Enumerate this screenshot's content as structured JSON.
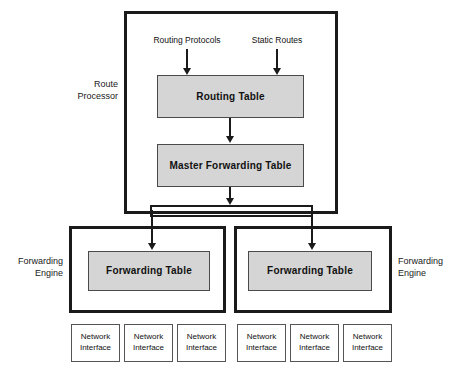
{
  "diagram": {
    "colors": {
      "table_fill": "#d5d5d5",
      "outline": "#1a1a1a",
      "interface_fill": "#ffffff"
    }
  },
  "route_processor": {
    "label": "Route\nProcessor",
    "inlets": [
      {
        "label": "Routing Protocols"
      },
      {
        "label": "Static Routes"
      }
    ],
    "routing_table": {
      "label": "Routing Table"
    },
    "master_forwarding_table": {
      "label": "Master Forwarding Table"
    }
  },
  "forwarding_engines": [
    {
      "label": "Forwarding\nEngine",
      "table": {
        "label": "Forwarding Table"
      },
      "interfaces": [
        {
          "label": "Network\nInterface"
        },
        {
          "label": "Network\nInterface"
        },
        {
          "label": "Network\nInterface"
        }
      ]
    },
    {
      "label": "Forwarding\nEngine",
      "table": {
        "label": "Forwarding Table"
      },
      "interfaces": [
        {
          "label": "Network\nInterface"
        },
        {
          "label": "Network\nInterface"
        },
        {
          "label": "Network\nInterface"
        }
      ]
    }
  ]
}
